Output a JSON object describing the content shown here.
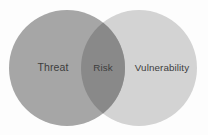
{
  "figure": {
    "type": "venn-diagram",
    "background_color": "#fdfdfd"
  },
  "chart_data": {
    "type": "venn",
    "title": "",
    "sets": [
      {
        "id": "threat",
        "label": "Threat",
        "color": "#a6a6a6",
        "cx": 67,
        "cy": 68,
        "r": 58,
        "label_x": 53,
        "label_y": 68
      },
      {
        "id": "vulnerability",
        "label": "Vulnerability",
        "color": "#d3d3d3",
        "cx": 139,
        "cy": 68,
        "r": 58,
        "label_x": 162,
        "label_y": 68
      }
    ],
    "intersections": [
      {
        "id": "risk",
        "label": "Risk",
        "of": [
          "threat",
          "vulnerability"
        ],
        "color": "#898989",
        "label_x": 103,
        "label_y": 68
      }
    ],
    "label_color": "#3d3d3d",
    "legend": "none",
    "grid": false
  }
}
